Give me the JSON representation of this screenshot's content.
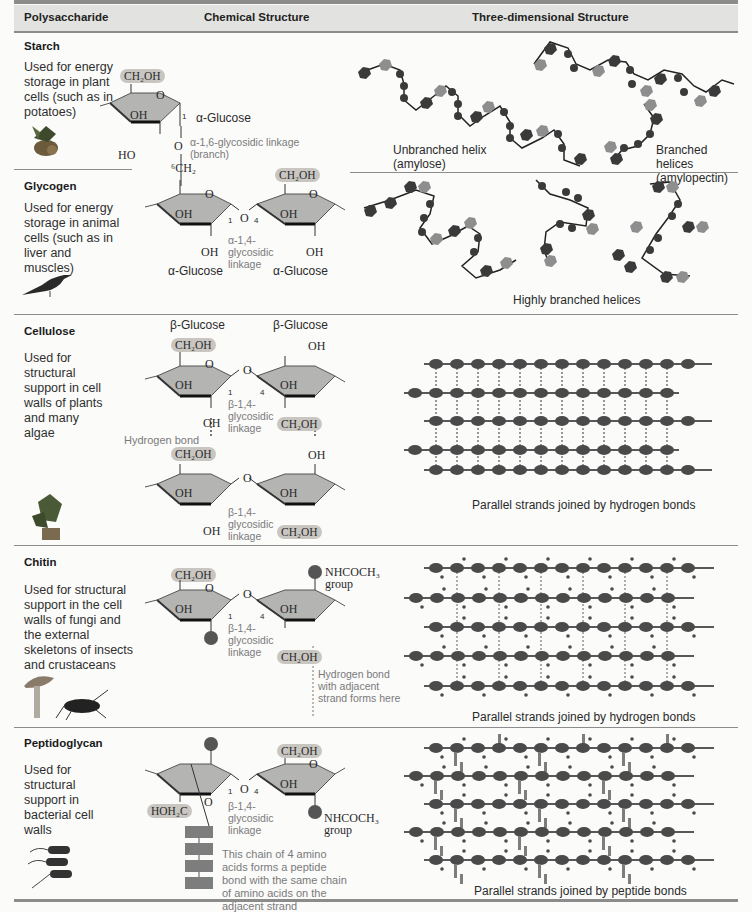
{
  "header": {
    "col1": "Polysaccharide",
    "col2": "Chemical Structure",
    "col3": "Three-dimensional Structure"
  },
  "rows": {
    "starch": {
      "name": "Starch",
      "description": "Used for energy storage in plant cells (such as in potatoes)",
      "icon": "potato-plant-icon",
      "chem": {
        "ch2oh": "CH₂OH",
        "oh": "OH",
        "ho": "HO",
        "ring_o": "O",
        "carbon1": "1",
        "sugar_label": "α-Glucose",
        "link_o": "O",
        "linkage": "α-1,6-glycosidic linkage (branch)"
      },
      "structure_captions": [
        "Unbranched helix (amylose)",
        "Branched helices (amylopectin)"
      ]
    },
    "glycogen": {
      "name": "Glycogen",
      "description": "Used for energy storage in animal cells (such as in liver and muscles)",
      "icon": "bird-icon",
      "chem": {
        "c6h2": "⁶CH₂",
        "ch2oh": "CH₂OH",
        "oh": "OH",
        "ring_o": "O",
        "link_o": "O",
        "carbon1": "1",
        "carbon4": "4",
        "linkage": "α-1,4-glycosidic linkage",
        "sugar_left": "α-Glucose",
        "sugar_right": "α-Glucose"
      },
      "structure_caption": "Highly branched helices"
    },
    "cellulose": {
      "name": "Cellulose",
      "description": "Used for structural support in cell walls of plants and many algae",
      "icon": "plant-icon",
      "chem": {
        "sugar_left": "β-Glucose",
        "sugar_right": "β-Glucose",
        "ch2oh": "CH₂OH",
        "oh": "OH",
        "ring_o": "O",
        "link_o": "O",
        "carbon1": "1",
        "carbon4": "4",
        "linkage": "β-1,4-glycosidic linkage",
        "hbond": "Hydrogen bond"
      },
      "structure_caption": "Parallel strands joined by hydrogen bonds"
    },
    "chitin": {
      "name": "Chitin",
      "description": "Used for structural support in the cell walls of fungi and the external skeletons of insects and crustaceans",
      "icons": [
        "mushroom-icon",
        "cricket-icon"
      ],
      "chem": {
        "ch2oh": "CH₂OH",
        "oh": "OH",
        "ring_o": "O",
        "link_o": "O",
        "carbon1": "1",
        "carbon4": "4",
        "linkage": "β-1,4-glycosidic linkage",
        "group": "NHCOCH₃ group",
        "hbond_note": "Hydrogen bond with adjacent strand forms here"
      },
      "structure_caption": "Parallel strands joined by hydrogen bonds"
    },
    "peptidoglycan": {
      "name": "Peptidoglycan",
      "description": "Used for structural support in bacterial cell walls",
      "icon": "bacteria-icon",
      "chem": {
        "ch2oh": "CH₂OH",
        "hoh2c": "HOH₂C",
        "oh": "OH",
        "ring_o": "O",
        "link_o": "O",
        "carbon1": "1",
        "carbon4": "4",
        "linkage": "β-1,4-glycosidic linkage",
        "group": "NHCOCH₃ group",
        "chain_note": "This chain of 4 amino acids forms a peptide bond with the same chain of amino acids on the adjacent strand"
      },
      "structure_caption": "Parallel strands joined by peptide bonds"
    }
  },
  "colors": {
    "header_bg": "#e2e2e0",
    "rule": "#8c8c8c",
    "ring_fill": "#b4b4b2",
    "pill": "#c9c6c2",
    "monomer_dark": "#333333",
    "monomer_light": "#9a9a9a",
    "peptide": "#7d7d7d"
  }
}
